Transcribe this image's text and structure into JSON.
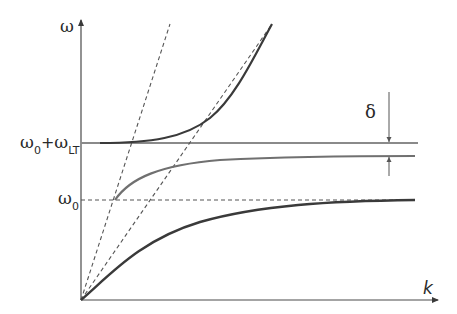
{
  "diagram": {
    "type": "dispersion-relation",
    "axes": {
      "y_label": "ω",
      "x_label": "k"
    },
    "levels": {
      "omega0_label": {
        "symbol": "ω",
        "subscript": "0"
      },
      "omega0_plus_omegaLT_label": {
        "first_symbol": "ω",
        "first_subscript": "0",
        "operator": "+",
        "second_symbol": "ω",
        "second_subscript": "LT"
      }
    },
    "annotations": {
      "gap_label": "δ"
    },
    "curves": [
      {
        "name": "upper-polariton-branch",
        "style": "solid",
        "description": "starts near ω0+ωLT level, rises steeply with k"
      },
      {
        "name": "middle-branch",
        "style": "solid",
        "description": "starts at ω0 and asymptotes just below ω0+ωLT (gap δ)"
      },
      {
        "name": "lower-polariton-branch",
        "style": "solid",
        "description": "starts at origin and asymptotes to ω0"
      },
      {
        "name": "steep-light-line",
        "style": "dashed"
      },
      {
        "name": "shallow-light-line",
        "style": "dashed"
      },
      {
        "name": "omega0-level",
        "style": "dashed"
      },
      {
        "name": "omega0-plus-omegaLT-level",
        "style": "solid"
      }
    ],
    "colors": {
      "axis": "#4a4a4a",
      "curve_dark": "#3a3a3a",
      "curve_mid": "#707070",
      "line_gray": "#8a8a8a",
      "dash": "#555555"
    }
  }
}
